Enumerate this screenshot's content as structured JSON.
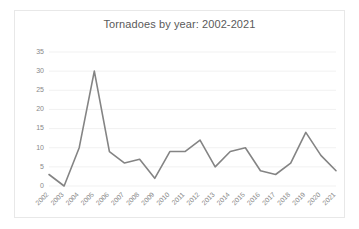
{
  "chart_data": {
    "type": "line",
    "title": "Tornadoes by year: 2002-2021",
    "xlabel": "",
    "ylabel": "",
    "categories": [
      "2002",
      "2003",
      "2004",
      "2005",
      "2006",
      "2007",
      "2008",
      "2009",
      "2010",
      "2011",
      "2012",
      "2013",
      "2014",
      "2015",
      "2016",
      "2017",
      "2018",
      "2019",
      "2020",
      "2021"
    ],
    "values": [
      3,
      0,
      10,
      30,
      9,
      6,
      7,
      2,
      9,
      9,
      12,
      5,
      9,
      10,
      4,
      3,
      6,
      14,
      8,
      4
    ],
    "series": [
      {
        "name": "Tornadoes",
        "values": [
          3,
          0,
          10,
          30,
          9,
          6,
          7,
          2,
          9,
          9,
          12,
          5,
          9,
          10,
          4,
          3,
          6,
          14,
          8,
          4
        ]
      }
    ],
    "ylim": [
      0,
      35
    ],
    "yticks": [
      0,
      5,
      10,
      15,
      20,
      25,
      30,
      35
    ],
    "ytick_labels": [
      "0",
      "5",
      "10",
      "15",
      "20",
      "25",
      "30",
      "35"
    ],
    "grid": true,
    "legend": false,
    "legend_position": "none",
    "line_color": "#848484",
    "grid_color": "#ededed",
    "text_color": "#888888",
    "title_color": "#5a5a5a",
    "background_color": "#ffffff",
    "border_color": "#e8e8e8",
    "xtick_rotation": -45
  }
}
